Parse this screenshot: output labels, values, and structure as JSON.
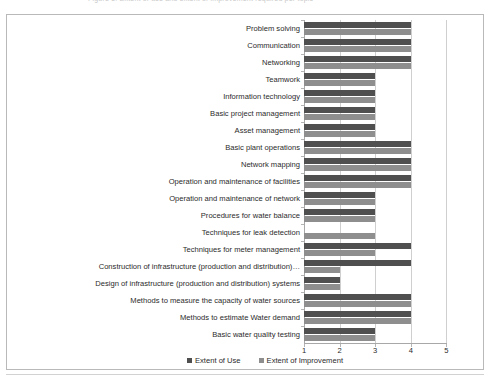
{
  "caption": {
    "text": "Figure 5: Extent of use and extent of improvement required per topic"
  },
  "legend": {
    "position": "bottom",
    "items": [
      {
        "label": "Extent of Use",
        "color": "#4f4f4f",
        "swatch": "square-swatch-icon"
      },
      {
        "label": "Extent of Improvement",
        "color": "#8e8e8e",
        "swatch": "square-swatch-icon"
      }
    ]
  },
  "axis": {
    "x_ticks": [
      "1",
      "2",
      "3",
      "4",
      "5"
    ],
    "x_min": 1,
    "x_max": 5
  },
  "chart_data": {
    "type": "bar",
    "orientation": "horizontal",
    "title": "",
    "xlabel": "",
    "ylabel": "",
    "xlim": [
      1,
      5
    ],
    "grid": true,
    "legend_position": "bottom",
    "categories": [
      "Problem solving",
      "Communication",
      "Networking",
      "Teamwork",
      "Information technology",
      "Basic project management",
      "Asset management",
      "Basic plant operations",
      "Network mapping",
      "Operation and maintenance of facilities",
      "Operation and maintenance of network",
      "Procedures for water balance",
      "Techniques  for leak detection",
      "Techniques for meter management",
      "Construction of infrastructure (production and distribution)…",
      "Design of infrastructure (production and distribution) systems",
      "Methods to measure the capacity of water sources",
      "Methods to estimate Water demand",
      "Basic water quality testing"
    ],
    "series": [
      {
        "name": "Extent of Use",
        "color": "#4f4f4f",
        "values": [
          4,
          4,
          4,
          3,
          3,
          3,
          3,
          4,
          4,
          4,
          3,
          3,
          1,
          4,
          4,
          2,
          4,
          4,
          3
        ]
      },
      {
        "name": "Extent of Improvement",
        "color": "#8e8e8e",
        "values": [
          4,
          4,
          4,
          3,
          3,
          3,
          3,
          4,
          4,
          4,
          3,
          3,
          3,
          3,
          2,
          2,
          4,
          4,
          3
        ]
      }
    ]
  }
}
